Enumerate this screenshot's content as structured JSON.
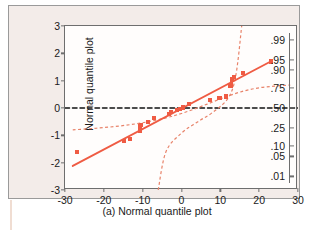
{
  "figure": {
    "caption": "(a) Normal quantile plot",
    "background_color": "#f3ece9",
    "accent_color": "#ef5b43"
  },
  "chart_data": {
    "type": "scatter",
    "title": "",
    "subtitle": "",
    "xlabel": "",
    "ylabel": "Normal quantile plot",
    "xlim": [
      -30,
      30
    ],
    "ylim": [
      -3,
      3
    ],
    "grid": false,
    "legend": "none",
    "x_ticks": [
      "-30",
      "-20",
      "-10",
      "0",
      "10",
      "20",
      "30"
    ],
    "x_tick_values": [
      -30,
      -20,
      -10,
      0,
      10,
      20,
      30
    ],
    "y_ticks": [
      "3",
      "2",
      "1",
      "0",
      "-1",
      "-2",
      "-3"
    ],
    "y_tick_values": [
      3,
      2,
      1,
      0,
      -1,
      -2,
      -3
    ],
    "right_axis_label": "",
    "right_ticks": [
      ".99",
      ".95",
      ".90",
      ".75",
      ".50",
      ".25",
      ".10",
      ".05",
      ".01"
    ],
    "right_tick_values": [
      0.99,
      0.95,
      0.9,
      0.75,
      0.5,
      0.25,
      0.1,
      0.05,
      0.01
    ],
    "right_tick_quantiles": [
      2.326,
      1.645,
      1.282,
      0.674,
      0.0,
      -0.674,
      -1.282,
      -1.645,
      -2.326
    ],
    "series": [
      {
        "name": "Data points",
        "marker": "square",
        "color": "#ef5b43",
        "points": [
          {
            "x": -27.0,
            "y": -1.6
          },
          {
            "x": -14.8,
            "y": -1.2
          },
          {
            "x": -13.2,
            "y": -1.12
          },
          {
            "x": -10.6,
            "y": -0.8
          },
          {
            "x": -10.6,
            "y": -0.7
          },
          {
            "x": -10.4,
            "y": -0.62
          },
          {
            "x": -8.6,
            "y": -0.52
          },
          {
            "x": -7.0,
            "y": -0.38
          },
          {
            "x": -3.2,
            "y": -0.22
          },
          {
            "x": -2.8,
            "y": -0.16
          },
          {
            "x": -1.2,
            "y": -0.06
          },
          {
            "x": -0.4,
            "y": -0.04
          },
          {
            "x": 0.4,
            "y": 0.02
          },
          {
            "x": 2.0,
            "y": 0.14
          },
          {
            "x": 7.4,
            "y": 0.28
          },
          {
            "x": 9.8,
            "y": 0.38
          },
          {
            "x": 11.4,
            "y": 0.42
          },
          {
            "x": 12.6,
            "y": 0.8
          },
          {
            "x": 13.0,
            "y": 1.02
          },
          {
            "x": 13.6,
            "y": 1.12
          },
          {
            "x": 15.8,
            "y": 1.28
          },
          {
            "x": 23.0,
            "y": 1.7
          }
        ]
      },
      {
        "name": "Fitted reference line",
        "type": "line",
        "style": "solid",
        "color": "#ef5b43",
        "x": [
          -28.0,
          23.2
        ],
        "y": [
          -2.12,
          1.72
        ]
      },
      {
        "name": "Upper confidence band",
        "type": "line",
        "style": "dashed",
        "color": "#e8836a",
        "x": [
          -28.0,
          -22.0,
          -16.0,
          -10.0,
          -4.0,
          0.0,
          4.0,
          8.0,
          12.0,
          16.0,
          20.0,
          24.0,
          28.0
        ],
        "y": [
          -0.8,
          -0.74,
          -0.66,
          -0.54,
          -0.36,
          -0.2,
          0.0,
          0.22,
          0.44,
          0.62,
          0.74,
          0.8,
          0.84
        ]
      },
      {
        "name": "Lower confidence band",
        "type": "line",
        "style": "dashed",
        "color": "#e8836a",
        "x": [
          -6.0,
          -4.0,
          0.0,
          4.0,
          8.0,
          12.0,
          14.0,
          15.5
        ],
        "y": [
          -3.0,
          -1.6,
          -0.92,
          -0.52,
          -0.16,
          0.36,
          1.2,
          3.0
        ]
      },
      {
        "name": "Zero reference line",
        "type": "line",
        "style": "dashed",
        "color": "#111111",
        "x": [
          -30.0,
          30.0
        ],
        "y": [
          0.0,
          0.0
        ]
      }
    ]
  }
}
